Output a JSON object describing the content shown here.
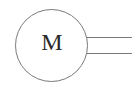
{
  "symbol": {
    "type": "electric-motor",
    "label": "M",
    "stroke_color": "#7a7a7a",
    "text_color": "#2a2a2a",
    "background": "#ffffff"
  }
}
